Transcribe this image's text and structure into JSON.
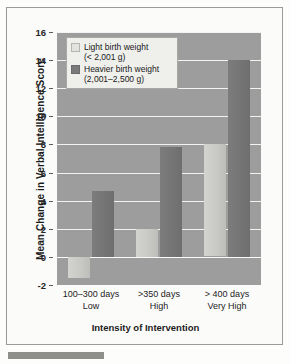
{
  "chart_data": {
    "type": "bar",
    "title": "",
    "xlabel": "Intensity of Intervention",
    "ylabel": "Mean Change in Verbal Intelligence Score",
    "ylim": [
      -2,
      16
    ],
    "yticks": [
      16,
      14,
      12,
      10,
      8,
      6,
      4,
      2,
      0,
      -2
    ],
    "grid": true,
    "legend_position": "top-left",
    "categories": [
      "100–300 days",
      ">350 days",
      "> 400 days"
    ],
    "category_sublabels": [
      "Low",
      "High",
      "Very High"
    ],
    "series": [
      {
        "name": "Light birth weight (< 2,001 g)",
        "name_line1": "Light birth weight",
        "name_line2": "(< 2,001 g)",
        "color": "#d0d0cd",
        "values": [
          -1.5,
          2.0,
          8.0
        ]
      },
      {
        "name": "Heavier birth weight (2,001–2,500 g)",
        "name_line1": "Heavier birth weight",
        "name_line2": "(2,001–2,500 g)",
        "color": "#787878",
        "values": [
          4.7,
          7.8,
          14.0
        ]
      }
    ]
  },
  "axis": {
    "y_title": "Mean Change in Verbal Intelligence Score",
    "x_title": "Intensity of Intervention",
    "y_tick_labels": [
      "16",
      "14",
      "12",
      "10",
      "8",
      "6",
      "4",
      "2",
      "0",
      "-2"
    ],
    "x_labels": [
      {
        "line1": "100–300 days",
        "line2": "Low"
      },
      {
        "line1": ">350 days",
        "line2": "High"
      },
      {
        "line1": "> 400 days",
        "line2": "Very High"
      }
    ]
  },
  "legend": {
    "items": [
      {
        "line1": "Light birth weight",
        "line2": "(< 2,001 g)",
        "swatch": "light-swatch"
      },
      {
        "line1": "Heavier birth weight",
        "line2": "(2,001–2,500 g)",
        "swatch": "dark-swatch"
      }
    ]
  }
}
